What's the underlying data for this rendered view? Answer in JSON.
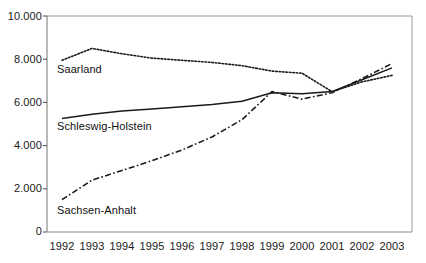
{
  "chart_data": {
    "type": "line",
    "title": "",
    "subtitle": "",
    "xlabel": "",
    "ylabel": "",
    "grid": false,
    "legend_position": "inline-labels",
    "x": [
      1992,
      1993,
      1994,
      1995,
      1996,
      1997,
      1998,
      1999,
      2000,
      2001,
      2002,
      2003
    ],
    "categories": [
      "1992",
      "1993",
      "1994",
      "1995",
      "1996",
      "1997",
      "1998",
      "1999",
      "2000",
      "2001",
      "2002",
      "2003"
    ],
    "xlim": [
      1992,
      2003
    ],
    "ylim": [
      0,
      10000
    ],
    "ytick_values": [
      0,
      2000,
      4000,
      6000,
      8000,
      10000
    ],
    "ytick_labels": [
      "0",
      "2.000",
      "4.000",
      "6.000",
      "8.000",
      "10.000"
    ],
    "xtick_labels": [
      "1992",
      "1993",
      "1994",
      "1995",
      "1996",
      "1997",
      "1998",
      "1999",
      "2000",
      "2001",
      "2002",
      "2003"
    ],
    "series": [
      {
        "name": "Saarland",
        "label": "Saarland",
        "style": "dotted",
        "color": "#1a1a1a",
        "values": [
          7950,
          8500,
          8250,
          8050,
          7950,
          7850,
          7700,
          7450,
          7350,
          6500,
          6950,
          7250
        ]
      },
      {
        "name": "Schleswig-Holstein",
        "label": "Schleswig-Holstein",
        "style": "solid",
        "color": "#1a1a1a",
        "values": [
          5250,
          5450,
          5600,
          5700,
          5800,
          5900,
          6050,
          6450,
          6400,
          6500,
          7050,
          7600
        ]
      },
      {
        "name": "Sachsen-Anhalt",
        "label": "Sachsen-Anhalt",
        "style": "dash-dot",
        "color": "#1a1a1a",
        "values": [
          1500,
          2400,
          2850,
          3300,
          3800,
          4400,
          5200,
          6500,
          6150,
          6450,
          7100,
          7800
        ]
      }
    ],
    "annotations": [
      {
        "text": "Saarland",
        "series": "Saarland"
      },
      {
        "text": "Schleswig-Holstein",
        "series": "Schleswig-Holstein"
      },
      {
        "text": "Sachsen-Anhalt",
        "series": "Sachsen-Anhalt"
      }
    ]
  },
  "axes": {
    "y_labels": [
      "10.000",
      "8.000",
      "6.000",
      "4.000",
      "2.000",
      "0"
    ],
    "x_labels": [
      "1992",
      "1993",
      "1994",
      "1995",
      "1996",
      "1997",
      "1998",
      "1999",
      "2000",
      "2001",
      "2002",
      "2003"
    ]
  },
  "labels": {
    "saarland": "Saarland",
    "schleswig_holstein": "Schleswig-Holstein",
    "sachsen_anhalt": "Sachsen-Anhalt"
  }
}
